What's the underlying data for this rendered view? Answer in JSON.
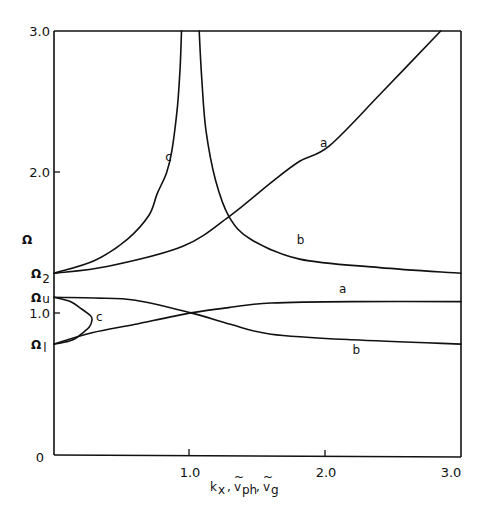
{
  "chart_data": {
    "type": "line",
    "title": "",
    "xlabel": "k_x , ṽ_ph , ṽ_g",
    "ylabel": "Ω",
    "xlim": [
      0,
      3.0
    ],
    "ylim": [
      0,
      3.0
    ],
    "grid": false,
    "legend": "none (curves labeled inline a, b, c)",
    "x_ticks": [
      "1.0",
      "2.0",
      "3.0"
    ],
    "y_ticks": [
      "0",
      "1.0",
      "2.0",
      "3.0"
    ],
    "y_annotations": [
      {
        "label": "Ω2",
        "value": 1.29
      },
      {
        "label": "Ωu",
        "value": 1.12
      },
      {
        "label": "Ω1",
        "value": 0.79
      }
    ],
    "series": [
      {
        "name": "a (upper branch)",
        "label": "a",
        "points": [
          [
            0,
            1.29
          ],
          [
            0.4,
            1.34
          ],
          [
            0.95,
            1.48
          ],
          [
            1.29,
            1.69
          ],
          [
            1.6,
            1.93
          ],
          [
            1.81,
            2.08
          ],
          [
            2.03,
            2.19
          ],
          [
            2.4,
            2.55
          ],
          [
            2.85,
            3.0
          ]
        ]
      },
      {
        "name": "b (upper branch)",
        "label": "b",
        "points": [
          [
            1.07,
            3.0
          ],
          [
            1.09,
            2.65
          ],
          [
            1.12,
            2.3
          ],
          [
            1.19,
            1.95
          ],
          [
            1.29,
            1.69
          ],
          [
            1.45,
            1.53
          ],
          [
            1.81,
            1.39
          ],
          [
            2.4,
            1.33
          ],
          [
            3.0,
            1.29
          ]
        ]
      },
      {
        "name": "c (upper branch)",
        "label": "c",
        "points": [
          [
            0,
            1.29
          ],
          [
            0.3,
            1.38
          ],
          [
            0.54,
            1.53
          ],
          [
            0.7,
            1.7
          ],
          [
            0.76,
            1.85
          ],
          [
            0.83,
            2.0
          ],
          [
            0.87,
            2.16
          ],
          [
            0.91,
            2.47
          ],
          [
            0.93,
            2.75
          ],
          [
            0.94,
            3.0
          ]
        ]
      },
      {
        "name": "a (lower branch)",
        "label": "a",
        "points": [
          [
            0,
            0.79
          ],
          [
            0.28,
            0.87
          ],
          [
            0.6,
            0.93
          ],
          [
            1.01,
            1.01
          ],
          [
            1.3,
            1.05
          ],
          [
            1.6,
            1.08
          ],
          [
            2.2,
            1.09
          ],
          [
            3.0,
            1.09
          ]
        ]
      },
      {
        "name": "b (lower branch)",
        "label": "b",
        "points": [
          [
            0,
            1.12
          ],
          [
            0.3,
            1.115
          ],
          [
            0.6,
            1.1
          ],
          [
            1.01,
            1.01
          ],
          [
            1.3,
            0.93
          ],
          [
            1.6,
            0.86
          ],
          [
            2.2,
            0.82
          ],
          [
            3.0,
            0.79
          ]
        ]
      },
      {
        "name": "c (lower branch)",
        "label": "c",
        "points": [
          [
            0,
            1.12
          ],
          [
            0.12,
            1.09
          ],
          [
            0.2,
            1.04
          ],
          [
            0.27,
            0.99
          ],
          [
            0.28,
            0.96
          ],
          [
            0.26,
            0.91
          ],
          [
            0.2,
            0.86
          ],
          [
            0.14,
            0.82
          ],
          [
            0.06,
            0.8
          ],
          [
            0,
            0.79
          ]
        ]
      }
    ],
    "curve_labels": [
      {
        "text": "a",
        "x": 1.96,
        "y": 2.18
      },
      {
        "text": "b",
        "x": 1.79,
        "y": 1.5
      },
      {
        "text": "c",
        "x": 0.82,
        "y": 2.08
      },
      {
        "text": "a",
        "x": 2.1,
        "y": 1.15
      },
      {
        "text": "b",
        "x": 2.2,
        "y": 0.72
      },
      {
        "text": "c",
        "x": 0.31,
        "y": 0.95
      }
    ]
  },
  "labels": {
    "x_axis_title": "k",
    "x_axis_sub_x": "x",
    "x_axis_v": "v",
    "x_axis_sub_ph": "ph",
    "x_axis_sub_g": "g",
    "x_axis_tilde": "~",
    "x_axis_comma": ",",
    "y_axis_title": "Ω",
    "omega2": "Ω",
    "omega2_sub": "2",
    "omegau": "Ω",
    "omegau_sub": "u",
    "omega1": "Ω",
    "omega1_sub": "l",
    "tick_y0": "0",
    "tick_y1": "1.0",
    "tick_y2": "2.0",
    "tick_y3": "3.0",
    "tick_x1": "1.0",
    "tick_x2": "2.0",
    "tick_x3": "3.0",
    "curve_a": "a",
    "curve_b": "b",
    "curve_c": "c"
  }
}
